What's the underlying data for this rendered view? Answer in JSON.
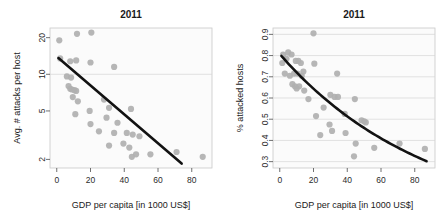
{
  "figure": {
    "width": 446,
    "height": 220,
    "background": "#ffffff",
    "point_color": "#b0b0b0",
    "line_color": "#121212",
    "grid_color": "#d6d6d6"
  },
  "panels": [
    {
      "id": "left",
      "title": "2011",
      "xlabel": "GDP per capita [in 1000 US$]",
      "ylabel": "Avg. # attacks per host"
    },
    {
      "id": "right",
      "title": "2011",
      "xlabel": "GDP per capita [in 1000 US$]",
      "ylabel": "% attacked hosts"
    }
  ],
  "chart_data": [
    {
      "type": "scatter",
      "id": "avg-attacks-per-host",
      "title": "2011",
      "xlabel": "GDP per capita [in 1000 US$]",
      "ylabel": "Avg. # attacks per host",
      "xlim": [
        -4,
        92
      ],
      "ylim": [
        1.7,
        24
      ],
      "yscale": "log",
      "xticks": [
        0,
        20,
        40,
        60,
        80
      ],
      "xticklabels": [
        "0",
        "20",
        "40",
        "60",
        "80"
      ],
      "yticks": [
        2,
        5,
        10,
        20
      ],
      "yticklabels": [
        "2",
        "5",
        "10",
        "20"
      ],
      "grid": "horizontal-at-y-10",
      "legend": "none",
      "points": [
        {
          "x": 1.5,
          "y": 19.0
        },
        {
          "x": 12.0,
          "y": 21.5
        },
        {
          "x": 20.5,
          "y": 22.0
        },
        {
          "x": 2.0,
          "y": 13.5
        },
        {
          "x": 8.0,
          "y": 12.8
        },
        {
          "x": 11.5,
          "y": 13.0
        },
        {
          "x": 20.0,
          "y": 12.5
        },
        {
          "x": 34.0,
          "y": 11.5
        },
        {
          "x": 6.0,
          "y": 9.6
        },
        {
          "x": 8.5,
          "y": 9.4
        },
        {
          "x": 7.0,
          "y": 8.0
        },
        {
          "x": 8.0,
          "y": 7.6
        },
        {
          "x": 9.0,
          "y": 7.5
        },
        {
          "x": 10.5,
          "y": 7.4
        },
        {
          "x": 11.5,
          "y": 7.3
        },
        {
          "x": 9.5,
          "y": 6.5
        },
        {
          "x": 12.5,
          "y": 6.0
        },
        {
          "x": 28.0,
          "y": 6.2
        },
        {
          "x": 11.0,
          "y": 4.7
        },
        {
          "x": 19.5,
          "y": 5.0
        },
        {
          "x": 31.0,
          "y": 5.3
        },
        {
          "x": 44.0,
          "y": 5.2
        },
        {
          "x": 20.0,
          "y": 3.9
        },
        {
          "x": 29.5,
          "y": 4.4
        },
        {
          "x": 36.0,
          "y": 4.0
        },
        {
          "x": 25.0,
          "y": 3.4
        },
        {
          "x": 34.0,
          "y": 3.3
        },
        {
          "x": 41.5,
          "y": 3.3
        },
        {
          "x": 45.0,
          "y": 3.2
        },
        {
          "x": 49.0,
          "y": 3.1
        },
        {
          "x": 31.0,
          "y": 2.6
        },
        {
          "x": 39.5,
          "y": 2.7
        },
        {
          "x": 43.0,
          "y": 2.5
        },
        {
          "x": 44.5,
          "y": 2.1
        },
        {
          "x": 47.0,
          "y": 2.2
        },
        {
          "x": 55.5,
          "y": 2.2
        },
        {
          "x": 71.0,
          "y": 2.3
        },
        {
          "x": 86.5,
          "y": 2.1
        }
      ],
      "fit": {
        "type": "loglinear",
        "x_start": 1.0,
        "x_end": 74.0,
        "y_start": 13.6,
        "y_end": 1.85
      }
    },
    {
      "type": "scatter",
      "id": "percent-attacked-hosts",
      "title": "2011",
      "xlabel": "GDP per capita [in 1000 US$]",
      "ylabel": "% attacked hosts",
      "xlim": [
        -4,
        92
      ],
      "ylim": [
        0.27,
        0.93
      ],
      "yscale": "linear",
      "xticks": [
        0,
        20,
        40,
        60,
        80
      ],
      "xticklabels": [
        "0",
        "20",
        "40",
        "60",
        "80"
      ],
      "yticks": [
        0.3,
        0.4,
        0.5,
        0.6,
        0.7,
        0.8,
        0.9
      ],
      "yticklabels": [
        "0.3",
        "0.4",
        "0.5",
        "0.6",
        "0.7",
        "0.8",
        "0.9"
      ],
      "grid": "horizontal",
      "legend": "none",
      "points": [
        {
          "x": 20.0,
          "y": 0.905
        },
        {
          "x": 2.0,
          "y": 0.805
        },
        {
          "x": 5.0,
          "y": 0.815
        },
        {
          "x": 7.0,
          "y": 0.805
        },
        {
          "x": 4.0,
          "y": 0.785
        },
        {
          "x": 1.5,
          "y": 0.765
        },
        {
          "x": 9.5,
          "y": 0.775
        },
        {
          "x": 11.0,
          "y": 0.775
        },
        {
          "x": 12.5,
          "y": 0.765
        },
        {
          "x": 20.5,
          "y": 0.762
        },
        {
          "x": 3.0,
          "y": 0.715
        },
        {
          "x": 6.0,
          "y": 0.705
        },
        {
          "x": 8.5,
          "y": 0.715
        },
        {
          "x": 10.5,
          "y": 0.715
        },
        {
          "x": 13.0,
          "y": 0.705
        },
        {
          "x": 14.0,
          "y": 0.725
        },
        {
          "x": 34.0,
          "y": 0.715
        },
        {
          "x": 7.5,
          "y": 0.665
        },
        {
          "x": 9.0,
          "y": 0.655
        },
        {
          "x": 10.0,
          "y": 0.645
        },
        {
          "x": 11.5,
          "y": 0.655
        },
        {
          "x": 14.5,
          "y": 0.635
        },
        {
          "x": 17.0,
          "y": 0.595
        },
        {
          "x": 30.0,
          "y": 0.615
        },
        {
          "x": 32.5,
          "y": 0.605
        },
        {
          "x": 34.5,
          "y": 0.605
        },
        {
          "x": 44.5,
          "y": 0.595
        },
        {
          "x": 26.0,
          "y": 0.555
        },
        {
          "x": 38.5,
          "y": 0.525
        },
        {
          "x": 21.5,
          "y": 0.515
        },
        {
          "x": 48.5,
          "y": 0.495
        },
        {
          "x": 50.0,
          "y": 0.49
        },
        {
          "x": 51.0,
          "y": 0.485
        },
        {
          "x": 29.5,
          "y": 0.475
        },
        {
          "x": 31.0,
          "y": 0.445
        },
        {
          "x": 39.0,
          "y": 0.435
        },
        {
          "x": 24.0,
          "y": 0.425
        },
        {
          "x": 45.0,
          "y": 0.385
        },
        {
          "x": 56.0,
          "y": 0.365
        },
        {
          "x": 71.0,
          "y": 0.385
        },
        {
          "x": 86.0,
          "y": 0.36
        },
        {
          "x": 44.0,
          "y": 0.325
        }
      ],
      "fit": {
        "type": "curve",
        "x_start": 1.0,
        "x_end": 87.0,
        "y_start": 0.798,
        "y_end": 0.302
      }
    }
  ]
}
